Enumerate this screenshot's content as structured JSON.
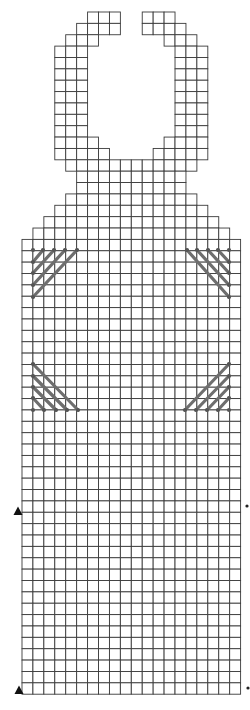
{
  "grid": {
    "origin_x": 22,
    "origin_y": 12,
    "cell_w": 10.93,
    "cell_h": 11.37,
    "columns": 20,
    "rows": 60,
    "line_color": "#3a3a3a",
    "fill_color": "#ffffff",
    "row_spans": [
      {
        "rows": [
          0,
          0
        ],
        "spans": [
          [
            6,
            8
          ],
          [
            11,
            13
          ]
        ]
      },
      {
        "rows": [
          1,
          1
        ],
        "spans": [
          [
            5,
            8
          ],
          [
            11,
            14
          ]
        ]
      },
      {
        "rows": [
          2,
          2
        ],
        "spans": [
          [
            4,
            6
          ],
          [
            13,
            15
          ]
        ]
      },
      {
        "rows": [
          3,
          10
        ],
        "spans": [
          [
            3,
            5
          ],
          [
            14,
            16
          ]
        ]
      },
      {
        "rows": [
          11,
          11
        ],
        "spans": [
          [
            3,
            6
          ],
          [
            13,
            16
          ]
        ]
      },
      {
        "rows": [
          12,
          12
        ],
        "spans": [
          [
            3,
            7
          ],
          [
            12,
            16
          ]
        ]
      },
      {
        "rows": [
          13,
          13
        ],
        "spans": [
          [
            4,
            15
          ]
        ]
      },
      {
        "rows": [
          14,
          15
        ],
        "spans": [
          [
            5,
            14
          ]
        ]
      },
      {
        "rows": [
          16,
          16
        ],
        "spans": [
          [
            4,
            15
          ]
        ]
      },
      {
        "rows": [
          17,
          17
        ],
        "spans": [
          [
            3,
            16
          ]
        ]
      },
      {
        "rows": [
          18,
          18
        ],
        "spans": [
          [
            2,
            17
          ]
        ]
      },
      {
        "rows": [
          19,
          19
        ],
        "spans": [
          [
            1,
            18
          ]
        ]
      },
      {
        "rows": [
          20,
          59
        ],
        "spans": [
          [
            0,
            19
          ]
        ]
      }
    ]
  },
  "hatches": {
    "color": "#6e6e6e",
    "groups": [
      {
        "name": "hatch-upper-left",
        "strokes": [
          [
            33,
            262,
            43,
            250
          ],
          [
            33,
            273,
            54,
            250
          ],
          [
            33,
            285,
            65,
            250
          ],
          [
            33,
            297,
            77,
            250
          ]
        ],
        "dots": [
          [
            33,
            250
          ],
          [
            43,
            250
          ],
          [
            54,
            250
          ],
          [
            65,
            250
          ],
          [
            77,
            250
          ],
          [
            33,
            262
          ],
          [
            33,
            273
          ],
          [
            33,
            285
          ],
          [
            33,
            297
          ]
        ]
      },
      {
        "name": "hatch-upper-right",
        "strokes": [
          [
            187,
            250,
            229,
            297
          ],
          [
            197,
            250,
            229,
            285
          ],
          [
            208,
            250,
            229,
            273
          ],
          [
            218,
            250,
            229,
            262
          ]
        ],
        "dots": [
          [
            187,
            250
          ],
          [
            197,
            250
          ],
          [
            208,
            250
          ],
          [
            218,
            250
          ],
          [
            229,
            250
          ],
          [
            229,
            262
          ],
          [
            229,
            273
          ],
          [
            229,
            285
          ],
          [
            229,
            297
          ]
        ]
      },
      {
        "name": "hatch-lower-left",
        "strokes": [
          [
            33,
            364,
            78,
            410
          ],
          [
            33,
            376,
            67,
            410
          ],
          [
            33,
            387,
            56,
            410
          ],
          [
            33,
            398,
            44,
            410
          ]
        ],
        "dots": [
          [
            33,
            364
          ],
          [
            33,
            376
          ],
          [
            33,
            387
          ],
          [
            33,
            398
          ],
          [
            33,
            410
          ],
          [
            44,
            410
          ],
          [
            56,
            410
          ],
          [
            67,
            410
          ],
          [
            78,
            410
          ]
        ]
      },
      {
        "name": "hatch-lower-right",
        "strokes": [
          [
            185,
            410,
            229,
            364
          ],
          [
            196,
            410,
            229,
            376
          ],
          [
            207,
            410,
            229,
            387
          ],
          [
            218,
            410,
            229,
            398
          ]
        ],
        "dots": [
          [
            229,
            364
          ],
          [
            229,
            376
          ],
          [
            229,
            387
          ],
          [
            229,
            398
          ],
          [
            229,
            410
          ],
          [
            185,
            410
          ],
          [
            196,
            410
          ],
          [
            207,
            410
          ],
          [
            218,
            410
          ]
        ]
      }
    ]
  },
  "markers": {
    "left_triangles": [
      {
        "name": "row-marker-triangle-upper",
        "x": 18,
        "y": 511,
        "symbol": "▲"
      },
      {
        "name": "row-marker-triangle-lower",
        "x": 19,
        "y": 690,
        "symbol": "▲"
      }
    ],
    "right_dots": [
      {
        "name": "row-marker-dot-upper",
        "x": 247,
        "y": 506,
        "symbol": "•"
      },
      {
        "name": "row-marker-dot-lower",
        "x": 248,
        "y": 688,
        "symbol": "•"
      }
    ]
  }
}
